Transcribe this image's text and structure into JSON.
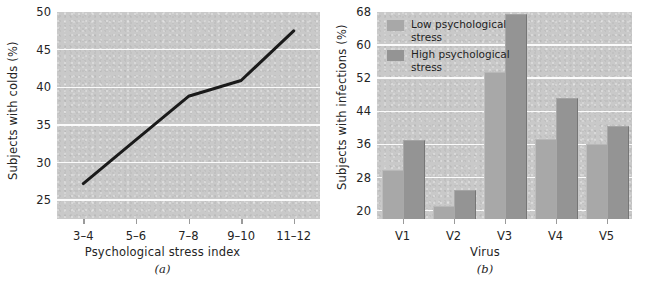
{
  "figure": {
    "background": "#ffffff",
    "plot_background": "#c9c9c9",
    "gridline_color": "#fbfbfb"
  },
  "chart_data": [
    {
      "panel": "a",
      "caption": "(a)",
      "type": "line",
      "title": "",
      "xlabel": "Psychological stress index",
      "ylabel": "Subjects with colds (%)",
      "categories": [
        "3–4",
        "5–6",
        "7–8",
        "9–10",
        "11–12"
      ],
      "values": [
        27.2,
        33.0,
        38.8,
        40.9,
        47.5
      ],
      "ylim": [
        22.5,
        50
      ],
      "yticks": [
        25,
        30,
        35,
        40,
        45,
        50
      ],
      "grid": true,
      "legend": "none",
      "line_color": "#1a1a1a",
      "line_width": 3
    },
    {
      "panel": "b",
      "caption": "(b)",
      "type": "bar",
      "title": "",
      "xlabel": "Virus",
      "ylabel": "Subjects with infections (%)",
      "categories": [
        "V1",
        "V2",
        "V3",
        "V4",
        "V5"
      ],
      "series": [
        {
          "name": "Low psychological stress",
          "color": "#a8a8a8",
          "values": [
            29.5,
            21.0,
            53.2,
            37.2,
            35.9
          ]
        },
        {
          "name": "High psychological stress",
          "color": "#949494",
          "values": [
            36.8,
            24.7,
            67.2,
            47.0,
            40.2
          ]
        }
      ],
      "ylim": [
        18,
        68
      ],
      "yticks": [
        20,
        28,
        36,
        44,
        52,
        60,
        68
      ],
      "grid": true,
      "legend": "top-left"
    }
  ]
}
